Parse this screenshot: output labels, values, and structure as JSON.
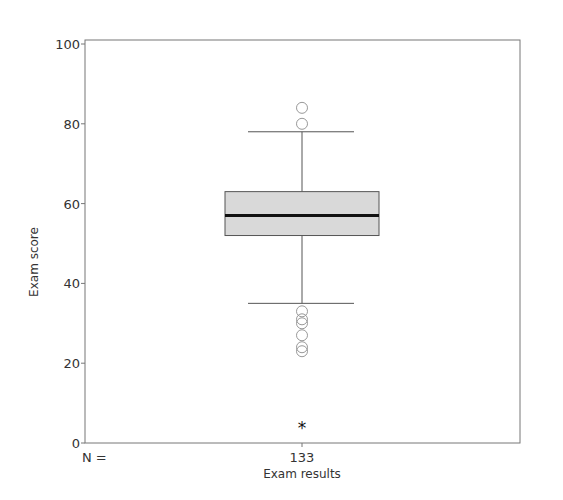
{
  "chart_data": {
    "type": "boxplot",
    "title": "",
    "xlabel": "Exam results",
    "ylabel": "Exam score",
    "ylim": [
      0,
      100
    ],
    "yticks": [
      0,
      20,
      40,
      60,
      80,
      100
    ],
    "ytick_labels": [
      "0",
      "20",
      "40",
      "60",
      "80",
      "100"
    ],
    "grid": false,
    "categories": [
      "Exam results"
    ],
    "n_label": "N =",
    "n_values": [
      "133"
    ],
    "series": [
      {
        "name": "Exam results",
        "n": 133,
        "whisker_low": 35,
        "q1": 52,
        "median": 57,
        "q3": 63,
        "whisker_high": 78,
        "outliers": [
          84,
          80,
          33,
          31,
          30,
          27,
          24,
          23
        ],
        "extremes": [
          4
        ]
      }
    ],
    "colors": {
      "box_fill": "#d9d9d9",
      "box_stroke": "#555555",
      "median": "#111111",
      "frame": "#777777",
      "outlier_stroke": "#999999"
    }
  }
}
